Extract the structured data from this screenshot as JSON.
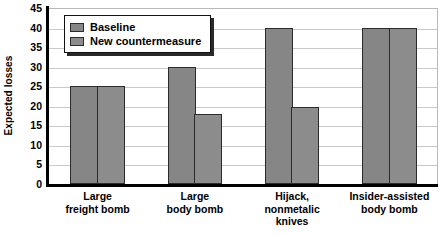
{
  "chart_data": {
    "type": "bar",
    "title": "",
    "xlabel": "",
    "ylabel": "Expected losses",
    "ylim": [
      0,
      45
    ],
    "yticks": [
      0,
      5,
      10,
      15,
      20,
      25,
      30,
      35,
      40,
      45
    ],
    "ytick_labels": [
      "0",
      "5",
      "10",
      "15",
      "20",
      "25",
      "30",
      "35",
      "40",
      "45"
    ],
    "grid": true,
    "legend_position": "upper-left",
    "categories": [
      "Large freight bomb",
      "Large body bomb",
      "Hijack, nonmetalic knives",
      "Insider-assisted body bomb"
    ],
    "category_lines": [
      [
        "Large",
        "freight bomb"
      ],
      [
        "Large",
        "body bomb"
      ],
      [
        "Hijack,",
        "nonmetalic",
        "knives"
      ],
      [
        "Insider-assisted",
        "body bomb"
      ]
    ],
    "series": [
      {
        "name": "Baseline",
        "color": "#868686",
        "values": [
          25,
          30,
          40,
          40
        ]
      },
      {
        "name": "New countermeasure",
        "color": "#8c8c8c",
        "values": [
          25,
          18,
          19.7,
          40
        ]
      }
    ]
  },
  "legend": {
    "items": [
      {
        "label": "Baseline",
        "swatch": "legend-swatch-baseline"
      },
      {
        "label": "New countermeasure",
        "swatch": "legend-swatch-new-countermeasure"
      }
    ]
  },
  "colors": {
    "bar_fill_baseline": "#868686",
    "bar_fill_countermeasure": "#8c8c8c",
    "bar_border": "#2b2b2b",
    "gridline": "#c9c9c9",
    "axis": "#000000",
    "background": "#ffffff"
  }
}
